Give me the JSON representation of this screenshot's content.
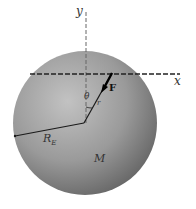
{
  "diagram": {
    "title": "",
    "labels": {
      "y_axis": "y",
      "x_axis": "x",
      "angle": "θ",
      "radius_vector": "r",
      "force": "F",
      "earth_radius": "R",
      "earth_radius_subscript": "E",
      "mass": "M"
    },
    "colors": {
      "sphere_light": "#b8b8b8",
      "sphere_dark": "#6a6a6a",
      "lines": "#1a1a1a",
      "axes": "#555555"
    }
  }
}
